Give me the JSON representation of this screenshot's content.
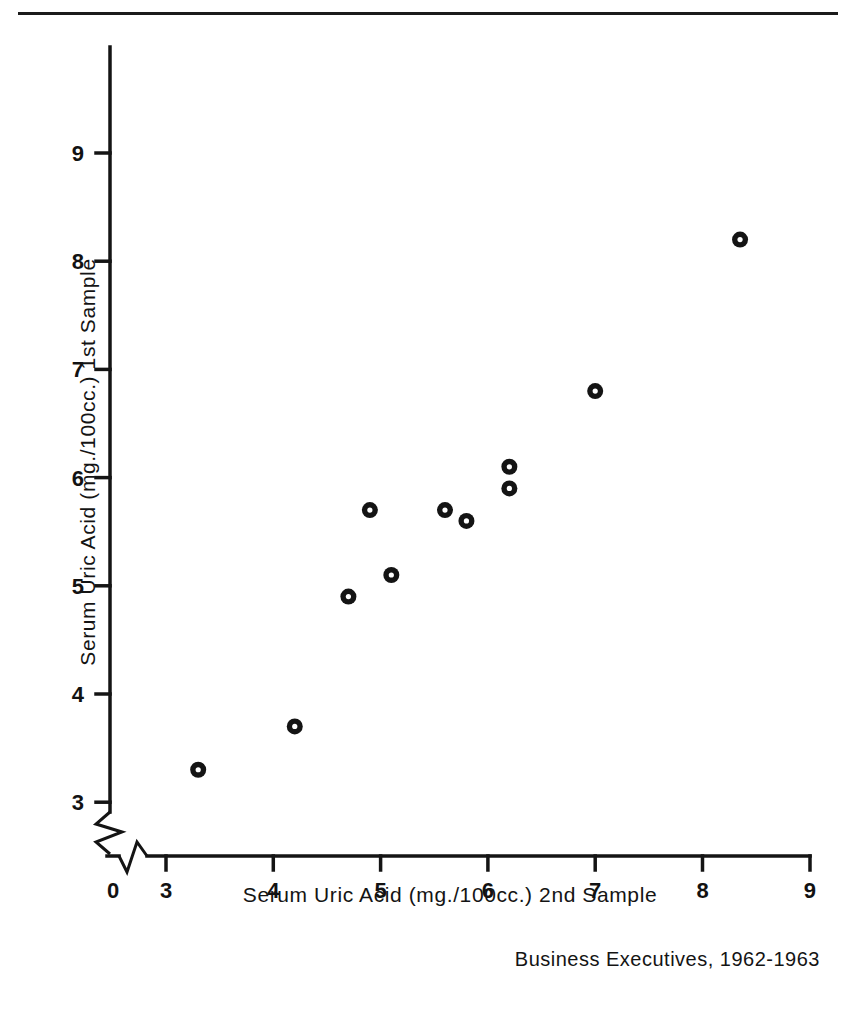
{
  "figure": {
    "caption": "Business Executives, 1962-1963",
    "line_color": "#141414",
    "marker_color": "#141414"
  },
  "chart_data": {
    "type": "scatter",
    "title": "",
    "subtitle": "",
    "annotations": [
      "Business Executives, 1962-1963"
    ],
    "xlabel": "Serum Uric Acid  (mg./100cc.)   2nd Sample",
    "ylabel": "Serum Uric Acid  (mg./100cc.)   1st Sample",
    "xlim": [
      0,
      9
    ],
    "ylim": [
      2.6,
      9.6
    ],
    "axis_break": {
      "x": true,
      "y": true,
      "note": "zigzag break near origin on both axes"
    },
    "grid": false,
    "legend": null,
    "xticks": [
      0,
      3,
      4,
      5,
      6,
      7,
      8,
      9
    ],
    "xticklabels": [
      "0",
      "3",
      "4",
      "5",
      "6",
      "7",
      "8",
      "9"
    ],
    "yticks": [
      3,
      4,
      5,
      6,
      7,
      8,
      9
    ],
    "yticklabels": [
      "3",
      "4",
      "5",
      "6",
      "7",
      "8",
      "9"
    ],
    "marker": "circle-with-white-center",
    "points": [
      {
        "x": 3.3,
        "y": 3.3
      },
      {
        "x": 4.2,
        "y": 3.7
      },
      {
        "x": 4.7,
        "y": 4.9
      },
      {
        "x": 4.9,
        "y": 5.7
      },
      {
        "x": 5.1,
        "y": 5.1
      },
      {
        "x": 5.6,
        "y": 5.7
      },
      {
        "x": 5.8,
        "y": 5.6
      },
      {
        "x": 6.2,
        "y": 5.9
      },
      {
        "x": 6.2,
        "y": 6.1
      },
      {
        "x": 7.0,
        "y": 6.8
      },
      {
        "x": 8.35,
        "y": 8.2
      }
    ]
  }
}
